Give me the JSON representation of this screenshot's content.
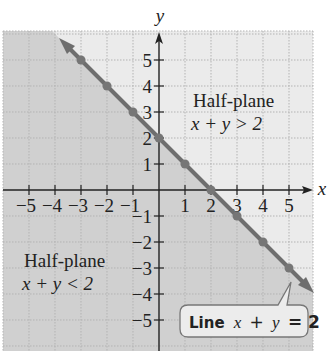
{
  "chart_data": {
    "type": "line",
    "title": "",
    "xlabel": "x",
    "ylabel": "y",
    "xlim": [
      -6.1,
      5.9
    ],
    "ylim": [
      -6.2,
      6.1
    ],
    "grid": true,
    "x_ticks": [
      -5,
      -4,
      -3,
      -2,
      -1,
      1,
      2,
      3,
      4,
      5
    ],
    "y_ticks": [
      -5,
      -4,
      -3,
      -2,
      -1,
      1,
      2,
      3,
      4,
      5
    ],
    "x_tick_labels": [
      "−5",
      "−4",
      "−3",
      "−2",
      "−1",
      "1",
      "2",
      "3",
      "4",
      "5"
    ],
    "y_tick_labels": [
      "−5",
      "−4",
      "−3",
      "−2",
      "−1",
      "1",
      "2",
      "3",
      "4",
      "5"
    ],
    "series": [
      {
        "name": "Line x + y = 2",
        "equation": "x + y = 2",
        "points": [
          [
            -3,
            5
          ],
          [
            -2,
            4
          ],
          [
            -1,
            3
          ],
          [
            0,
            2
          ],
          [
            1,
            1
          ],
          [
            2,
            0
          ],
          [
            3,
            -1
          ],
          [
            4,
            -2
          ],
          [
            5,
            -3
          ]
        ]
      }
    ],
    "shaded_region": "x + y < 2",
    "annotations": [
      {
        "text_line1": "Half-plane",
        "text_line2": "x + y > 2",
        "position": "upper-right"
      },
      {
        "text_line1": "Half-plane",
        "text_line2": "x + y < 2",
        "position": "lower-left"
      },
      {
        "text": "Line x + y = 2",
        "type": "callout",
        "points_to": [
          5,
          -3
        ]
      }
    ]
  },
  "labels": {
    "x_axis": "x",
    "y_axis": "y",
    "upper_region_title": "Half-plane",
    "upper_region_ineq": "x + y > 2",
    "lower_region_title": "Half-plane",
    "lower_region_ineq": "x + y < 2",
    "callout_word": "Line",
    "callout_eq_x": "x",
    "callout_plus": "+",
    "callout_eq_y": "y",
    "callout_eq_rest": "= 2"
  },
  "colors": {
    "shaded": "#d0d0d0",
    "unshaded": "#ebebeb",
    "line": "#6e6e6e",
    "grid": "#b3b3b3",
    "axis": "#222222"
  }
}
